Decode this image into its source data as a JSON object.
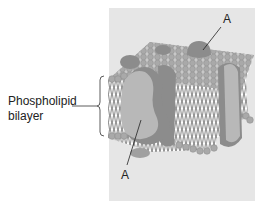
{
  "diagram": {
    "type": "cell membrane (fluid mosaic model)",
    "labels": {
      "phospholipid_line1": "Phospholipid",
      "phospholipid_line2": "bilayer",
      "protein_top": "A",
      "protein_bottom": "A"
    },
    "colors": {
      "panel_bg": "#e6e6e6",
      "head": "#a9a9a9",
      "head_stroke": "#8a8a8a",
      "protein_light": "#b8b8b8",
      "protein_dark": "#8c8c8c",
      "tail": "#333333",
      "text": "#222222"
    }
  }
}
